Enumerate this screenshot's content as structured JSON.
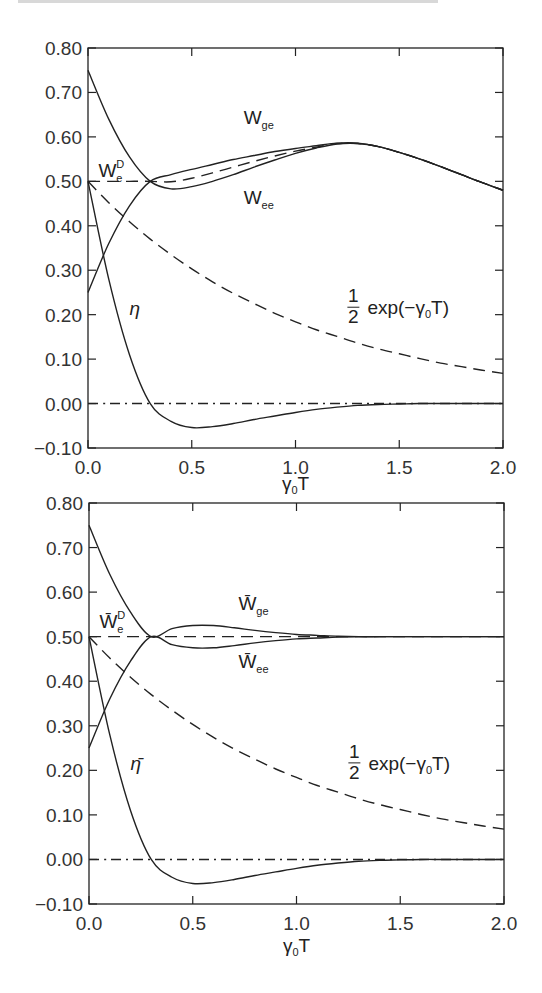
{
  "chart_data": [
    {
      "type": "line",
      "panel": "top",
      "title": "",
      "xlabel": "γ₀T",
      "ylabel": "",
      "xlim": [
        0.0,
        2.0
      ],
      "ylim": [
        -0.1,
        0.8
      ],
      "xticks": [
        "0.0",
        "0.5",
        "1.0",
        "1.5",
        "2.0"
      ],
      "yticks": [
        "0.80",
        "0.70",
        "0.60",
        "0.50",
        "0.40",
        "0.30",
        "0.20",
        "0.10",
        "0.00",
        "-0.10"
      ],
      "grid": false,
      "x": [
        0.0,
        0.1,
        0.2,
        0.3,
        0.4,
        0.5,
        0.6,
        0.7,
        0.8,
        0.9,
        1.0,
        1.1,
        1.2,
        1.3,
        1.4,
        1.5,
        1.6,
        1.7,
        1.8,
        1.9,
        2.0
      ],
      "series": [
        {
          "name": "W_ee",
          "style": "solid",
          "values": [
            0.75,
            0.64,
            0.555,
            0.5,
            0.483,
            0.488,
            0.5,
            0.515,
            0.532,
            0.548,
            0.563,
            0.575,
            0.584,
            0.585,
            0.578,
            0.565,
            0.55,
            0.533,
            0.515,
            0.497,
            0.48
          ]
        },
        {
          "name": "W_ge",
          "style": "solid",
          "values": [
            0.25,
            0.36,
            0.445,
            0.5,
            0.515,
            0.527,
            0.538,
            0.549,
            0.558,
            0.567,
            0.574,
            0.58,
            0.586,
            0.586,
            0.578,
            0.565,
            0.55,
            0.533,
            0.515,
            0.497,
            0.48
          ]
        },
        {
          "name": "W_e^D",
          "style": "dashed",
          "values": [
            0.5,
            0.5,
            0.5,
            0.5,
            0.499,
            0.507,
            0.519,
            0.532,
            0.545,
            0.557,
            0.568,
            0.577,
            0.585,
            0.585,
            0.578,
            0.565,
            0.55,
            0.533,
            0.515,
            0.497,
            0.48
          ]
        },
        {
          "name": "1/2 exp(-γ₀T)",
          "style": "dashed",
          "values": [
            0.5,
            0.452,
            0.409,
            0.37,
            0.335,
            0.303,
            0.274,
            0.248,
            0.225,
            0.203,
            0.184,
            0.166,
            0.151,
            0.136,
            0.123,
            0.112,
            0.101,
            0.091,
            0.083,
            0.075,
            0.068
          ]
        },
        {
          "name": "η",
          "style": "solid",
          "values": [
            0.5,
            0.28,
            0.11,
            0.0,
            -0.04,
            -0.054,
            -0.052,
            -0.045,
            -0.036,
            -0.028,
            -0.02,
            -0.013,
            -0.008,
            -0.004,
            -0.002,
            -0.001,
            0.0,
            0.0,
            0.0,
            0.0,
            0.0
          ]
        },
        {
          "name": "zero",
          "style": "dashdot",
          "values": [
            0,
            0,
            0,
            0,
            0,
            0,
            0,
            0,
            0,
            0,
            0,
            0,
            0,
            0,
            0,
            0,
            0,
            0,
            0,
            0,
            0
          ]
        }
      ],
      "annotations": [
        {
          "text": "W",
          "sub": "ge",
          "x": 0.75,
          "y": 0.63
        },
        {
          "text": "W",
          "sub": "ee",
          "x": 0.75,
          "y": 0.45
        },
        {
          "text": "W",
          "sup": "D",
          "sub": "e",
          "x": 0.05,
          "y": 0.51
        },
        {
          "text": "η",
          "x": 0.2,
          "y": 0.2
        },
        {
          "text": "1/2 exp(−γ₀T)",
          "x": 1.25,
          "y": 0.21
        }
      ]
    },
    {
      "type": "line",
      "panel": "bottom",
      "title": "",
      "xlabel": "γ₀T",
      "ylabel": "",
      "xlim": [
        0.0,
        2.0
      ],
      "ylim": [
        -0.1,
        0.8
      ],
      "xticks": [
        "0.0",
        "0.5",
        "1.0",
        "1.5",
        "2.0"
      ],
      "yticks": [
        "0.80",
        "0.70",
        "0.60",
        "0.50",
        "0.40",
        "0.30",
        "0.20",
        "0.10",
        "0.00",
        "-0.10"
      ],
      "grid": false,
      "x": [
        0.0,
        0.1,
        0.2,
        0.3,
        0.4,
        0.5,
        0.6,
        0.7,
        0.8,
        0.9,
        1.0,
        1.1,
        1.2,
        1.3,
        1.4,
        1.5,
        1.6,
        1.7,
        1.8,
        1.9,
        2.0
      ],
      "series": [
        {
          "name": "W̄_ge",
          "style": "solid",
          "values": [
            0.75,
            0.64,
            0.555,
            0.5,
            0.518,
            0.525,
            0.525,
            0.52,
            0.514,
            0.509,
            0.505,
            0.503,
            0.501,
            0.5,
            0.5,
            0.5,
            0.5,
            0.5,
            0.5,
            0.5,
            0.5
          ]
        },
        {
          "name": "W̄_ee",
          "style": "solid",
          "values": [
            0.25,
            0.36,
            0.445,
            0.5,
            0.482,
            0.475,
            0.475,
            0.48,
            0.486,
            0.491,
            0.495,
            0.497,
            0.499,
            0.5,
            0.5,
            0.5,
            0.5,
            0.5,
            0.5,
            0.5,
            0.5
          ]
        },
        {
          "name": "W̄_e^D",
          "style": "dashed",
          "values": [
            0.5,
            0.5,
            0.5,
            0.5,
            0.5,
            0.5,
            0.5,
            0.5,
            0.5,
            0.5,
            0.5,
            0.5,
            0.5,
            0.5,
            0.5,
            0.5,
            0.5,
            0.5,
            0.5,
            0.5,
            0.5
          ]
        },
        {
          "name": "1/2 exp(-γ₀T)",
          "style": "dashed",
          "values": [
            0.5,
            0.452,
            0.409,
            0.37,
            0.335,
            0.303,
            0.274,
            0.248,
            0.225,
            0.203,
            0.184,
            0.166,
            0.151,
            0.136,
            0.123,
            0.112,
            0.101,
            0.091,
            0.083,
            0.075,
            0.068
          ]
        },
        {
          "name": "η̄",
          "style": "solid",
          "values": [
            0.5,
            0.28,
            0.11,
            0.0,
            -0.04,
            -0.054,
            -0.052,
            -0.045,
            -0.036,
            -0.028,
            -0.02,
            -0.013,
            -0.008,
            -0.004,
            -0.002,
            -0.001,
            0.0,
            0.0,
            0.0,
            0.0,
            0.0
          ]
        },
        {
          "name": "zero",
          "style": "dashdot",
          "values": [
            0,
            0,
            0,
            0,
            0,
            0,
            0,
            0,
            0,
            0,
            0,
            0,
            0,
            0,
            0,
            0,
            0,
            0,
            0,
            0,
            0
          ]
        }
      ],
      "annotations": [
        {
          "text": "W̄",
          "sub": "ge",
          "x": 0.72,
          "y": 0.56
        },
        {
          "text": "W̄",
          "sub": "ee",
          "x": 0.72,
          "y": 0.43
        },
        {
          "text": "W̄",
          "sup": "D",
          "sub": "e",
          "x": 0.05,
          "y": 0.52
        },
        {
          "text": "η̄",
          "x": 0.2,
          "y": 0.2
        },
        {
          "text": "1/2 exp(−γ₀T)",
          "x": 1.25,
          "y": 0.21
        }
      ]
    }
  ],
  "labels": {
    "xlabel_gamma": "γ",
    "xlabel_sub": "0",
    "xlabel_T": "T",
    "exp_text": "exp(−γ",
    "exp_sub": "0",
    "exp_end": "T)",
    "frac_num": "1",
    "frac_den": "2"
  }
}
